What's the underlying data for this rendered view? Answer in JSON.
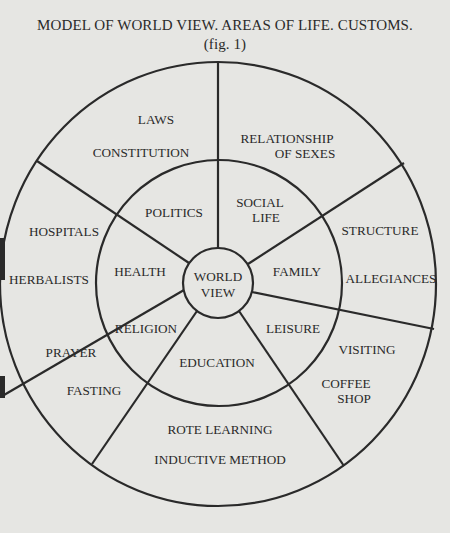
{
  "title": {
    "line1": "MODEL OF WORLD VIEW. AREAS OF LIFE. CUSTOMS.",
    "line2": "(fig. 1)"
  },
  "center": {
    "line1": "WORLD",
    "line2": "VIEW"
  },
  "areas": [
    {
      "name": "POLITICS",
      "customs": [
        "LAWS",
        "CONSTITUTION"
      ]
    },
    {
      "name_line1": "SOCIAL",
      "name_line2": "LIFE",
      "customs_line1": "RELATIONSHIP",
      "customs_line2": "OF SEXES"
    },
    {
      "name": "FAMILY",
      "customs": [
        "STRUCTURE",
        "ALLEGIANCES"
      ]
    },
    {
      "name": "LEISURE",
      "customs": [
        "VISITING"
      ],
      "custom2_line1": "COFFEE",
      "custom2_line2": "SHOP"
    },
    {
      "name": "EDUCATION",
      "customs": [
        "ROTE LEARNING",
        "INDUCTIVE METHOD"
      ]
    },
    {
      "name": "RELIGION",
      "customs": [
        "PRAYER",
        "FASTING"
      ]
    },
    {
      "name": "HEALTH",
      "customs": [
        "HOSPITALS",
        "HERBALISTS"
      ]
    }
  ],
  "colors": {
    "background": "#e6e6e3",
    "ink": "#2a2a2a"
  }
}
